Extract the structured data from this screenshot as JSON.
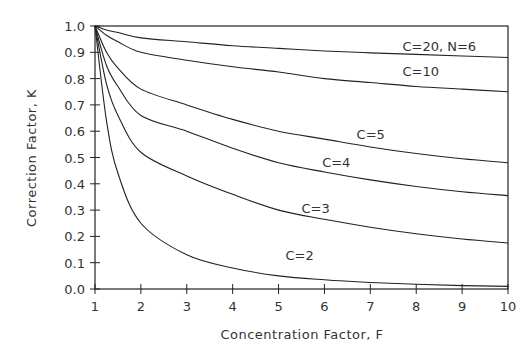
{
  "chart_data": {
    "type": "line",
    "title": "",
    "xlabel": "Concentration Factor, F",
    "ylabel": "Correction Factor, K",
    "xlim": [
      1,
      10
    ],
    "ylim": [
      0.0,
      1.0
    ],
    "grid": false,
    "legend": "inline curve labels",
    "xticks": [
      "1",
      "2",
      "3",
      "4",
      "5",
      "6",
      "7",
      "8",
      "9",
      "10"
    ],
    "yticks": [
      "0.0",
      "0.1",
      "0.2",
      "0.3",
      "0.4",
      "0.5",
      "0.6",
      "0.7",
      "0.8",
      "0.9",
      "1.0"
    ],
    "x": [
      1,
      1.25,
      1.5,
      2,
      3,
      4,
      5,
      6,
      7,
      8,
      9,
      10
    ],
    "series": [
      {
        "name": "C=20, N=6",
        "values": [
          1.0,
          0.985,
          0.975,
          0.955,
          0.94,
          0.925,
          0.915,
          0.905,
          0.898,
          0.892,
          0.886,
          0.88
        ],
        "label_pos": [
          7.7,
          0.905
        ]
      },
      {
        "name": "C=10",
        "values": [
          1.0,
          0.965,
          0.94,
          0.9,
          0.87,
          0.845,
          0.825,
          0.8,
          0.785,
          0.77,
          0.76,
          0.75
        ],
        "label_pos": [
          7.7,
          0.81
        ]
      },
      {
        "name": "C=5",
        "values": [
          1.0,
          0.9,
          0.84,
          0.76,
          0.7,
          0.645,
          0.6,
          0.57,
          0.54,
          0.515,
          0.495,
          0.48
        ],
        "label_pos": [
          6.7,
          0.57
        ]
      },
      {
        "name": "C=4",
        "values": [
          1.0,
          0.85,
          0.77,
          0.66,
          0.6,
          0.535,
          0.48,
          0.445,
          0.415,
          0.39,
          0.37,
          0.355
        ],
        "label_pos": [
          5.95,
          0.465
        ]
      },
      {
        "name": "C=3",
        "values": [
          1.0,
          0.78,
          0.66,
          0.52,
          0.43,
          0.36,
          0.3,
          0.265,
          0.235,
          0.21,
          0.19,
          0.175
        ],
        "label_pos": [
          5.5,
          0.29
        ]
      },
      {
        "name": "C=2",
        "values": [
          1.0,
          0.64,
          0.44,
          0.25,
          0.13,
          0.08,
          0.05,
          0.035,
          0.025,
          0.018,
          0.013,
          0.01
        ],
        "label_pos": [
          5.15,
          0.11
        ]
      }
    ]
  }
}
